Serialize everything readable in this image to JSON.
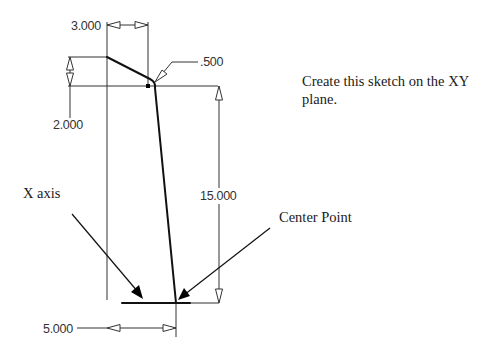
{
  "figure": {
    "instruction": "Create this sketch on the XY plane.",
    "dimensions": {
      "top_width": "3.000",
      "radius": ".500",
      "left_height": "2.000",
      "vertical_height": "15.000",
      "bottom_width": "5.000"
    },
    "callouts": {
      "x_axis": "X axis",
      "center_point": "Center Point"
    },
    "colors": {
      "geometry": "#111111",
      "dimension_lines": "#333333",
      "background": "#ffffff"
    }
  }
}
